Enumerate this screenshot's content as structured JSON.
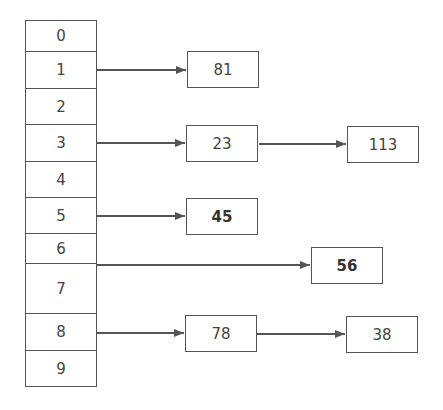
{
  "diagram": {
    "type": "hash-table-chaining",
    "buckets": [
      {
        "index": "0",
        "chain": []
      },
      {
        "index": "1",
        "chain": [
          "81"
        ]
      },
      {
        "index": "2",
        "chain": []
      },
      {
        "index": "3",
        "chain": [
          "23",
          "113"
        ]
      },
      {
        "index": "4",
        "chain": []
      },
      {
        "index": "5",
        "chain": [
          "45"
        ]
      },
      {
        "index": "6",
        "chain": [
          "56"
        ]
      },
      {
        "index": "7",
        "chain": []
      },
      {
        "index": "8",
        "chain": [
          "78",
          "38"
        ]
      },
      {
        "index": "9",
        "chain": []
      }
    ],
    "highlighted_nodes": [
      "45",
      "56"
    ],
    "colors": {
      "stroke": "#555555",
      "text": "#444444",
      "background": "#ffffff"
    }
  }
}
